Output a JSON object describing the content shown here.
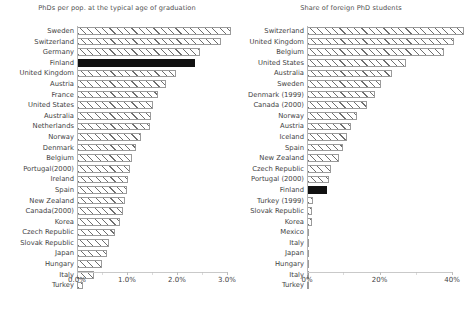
{
  "page": {
    "background": "#ffffff",
    "highlight_color": "#111111",
    "hatch_color": "#6e6e6e",
    "axis_color": "#c9c9c9"
  },
  "charts": [
    {
      "id": "phds-per-pop",
      "title": "PhDs per pop. at the typical age of graduation",
      "tick_labels": [
        "0.0%",
        "1.0%",
        "2.0%",
        "3.0%"
      ],
      "tick_values": [
        0,
        1,
        2,
        3
      ],
      "highlight": "Finland"
    },
    {
      "id": "share-foreign-phd",
      "title": "Share of foreign PhD students",
      "tick_labels": [
        "0%",
        "20%",
        "40%"
      ],
      "tick_values": [
        0,
        20,
        40
      ],
      "highlight": "Finland"
    }
  ],
  "chart_data": [
    {
      "type": "bar",
      "orientation": "horizontal",
      "title": "PhDs per pop. at the typical age of graduation",
      "xlabel": "",
      "ylabel": "",
      "xlim": [
        0,
        3.0
      ],
      "xticks": [
        0,
        1.0,
        2.0,
        3.0
      ],
      "xtick_labels": [
        "0.0%",
        "1.0%",
        "2.0%",
        "3.0%"
      ],
      "grid": false,
      "legend": "none",
      "unit": "%",
      "highlight_category": "Finland",
      "highlight_color": "#111111",
      "categories": [
        "Sweden",
        "Switzerland",
        "Germany",
        "Finland",
        "United Kingdom",
        "Austria",
        "France",
        "United States",
        "Australia",
        "Netherlands",
        "Norway",
        "Denmark",
        "Belgium",
        "Portugal(2000)",
        "Ireland",
        "Spain",
        "New Zealand",
        "Canada(2000)",
        "Korea",
        "Czech Republic",
        "Slovak Republic",
        "Japan",
        "Hungary",
        "Italy",
        "Turkey"
      ],
      "values": [
        2.95,
        2.75,
        2.35,
        2.25,
        1.9,
        1.7,
        1.55,
        1.45,
        1.42,
        1.4,
        1.22,
        1.12,
        1.05,
        1.02,
        0.98,
        0.95,
        0.92,
        0.88,
        0.82,
        0.72,
        0.62,
        0.58,
        0.48,
        0.32,
        0.12
      ]
    },
    {
      "type": "bar",
      "orientation": "horizontal",
      "title": "Share of foreign PhD students",
      "xlabel": "",
      "ylabel": "",
      "xlim": [
        0,
        40
      ],
      "xticks": [
        0,
        20,
        40
      ],
      "xtick_labels": [
        "0%",
        "20%",
        "40%"
      ],
      "grid": false,
      "legend": "none",
      "unit": "%",
      "highlight_category": "Finland",
      "highlight_color": "#111111",
      "categories": [
        "Switzerland",
        "United Kingdom",
        "Belgium",
        "United States",
        "Australia",
        "Sweden",
        "Denmark (1999)",
        "Canada (2000)",
        "Norway",
        "Austria",
        "Iceland",
        "Spain",
        "New Zealand",
        "Czech Republic",
        "Portugal (2000)",
        "Finland",
        "Turkey (1999)",
        "Slovak Republic",
        "Korea",
        "Mexico",
        "Italy",
        "Japan",
        "Hungary",
        "Italy",
        "Turkey"
      ],
      "values": [
        39.0,
        36.5,
        34.0,
        24.5,
        21.0,
        18.5,
        17.0,
        15.0,
        12.5,
        11.0,
        10.0,
        9.0,
        8.0,
        6.0,
        5.5,
        5.0,
        1.5,
        1.3,
        1.2,
        0.6,
        0.5,
        0.5,
        0.4,
        0.4,
        0.2
      ]
    }
  ]
}
